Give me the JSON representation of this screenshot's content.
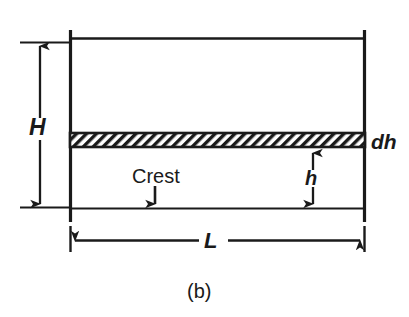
{
  "figure": {
    "caption": "(b)",
    "background_color": "#ffffff",
    "line_color": "#1a1a1a",
    "hatch_color": "#1a1a1a",
    "labels": {
      "total_head": "H",
      "differential_height": "dh",
      "height": "h",
      "length": "L",
      "crest": "Crest"
    },
    "dimensions": [
      {
        "name": "H",
        "label": "H",
        "orientation": "vertical",
        "from_y": 42,
        "to_y": 207,
        "axis_x": 40,
        "arrow_ends": "both"
      },
      {
        "name": "h",
        "label": "h",
        "orientation": "vertical",
        "from_y": 150,
        "to_y": 207,
        "axis_x": 313,
        "arrow_ends": "both"
      },
      {
        "name": "L",
        "label": "L",
        "orientation": "horizontal",
        "from_x": 70,
        "to_x": 365,
        "axis_y": 240,
        "arrow_ends": "both"
      }
    ],
    "annotations": [
      {
        "name": "crest-callout",
        "label": "Crest",
        "arrow_direction": "down",
        "target_y": 208
      },
      {
        "name": "dh-callout",
        "label": "dh",
        "points_to": "hatched-crest-band"
      }
    ],
    "geometry": {
      "left_wall_x": 70,
      "right_wall_x": 365,
      "top_line_y": 38,
      "bottom_line_y": 208,
      "wall_top_y": 30,
      "wall_bottom_y": 222,
      "crest_band_top_y": 133,
      "crest_band_bottom_y": 147
    }
  }
}
